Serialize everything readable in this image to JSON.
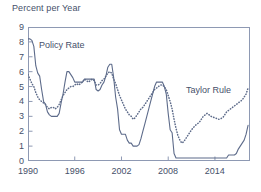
{
  "chart_data": {
    "type": "line",
    "title": "",
    "ylabel": "Percent per Year",
    "xlabel": "",
    "ylim": [
      0,
      9
    ],
    "xlim": [
      1990,
      2018.5
    ],
    "grid": false,
    "legend_position": "inline-annotations",
    "ytick_labels": [
      "0",
      "1",
      "2",
      "3",
      "4",
      "5",
      "6",
      "7",
      "8",
      "9"
    ],
    "ytick_values": [
      0,
      1,
      2,
      3,
      4,
      5,
      6,
      7,
      8,
      9
    ],
    "xtick_labels": [
      "1990",
      "1996",
      "2002",
      "2008",
      "2014"
    ],
    "xtick_values": [
      1990,
      1996,
      2002,
      2008,
      2014
    ],
    "series": [
      {
        "name": "Policy Rate",
        "style": "solid",
        "color": "#5d6b8a",
        "x": [
          1990.0,
          1990.25,
          1990.5,
          1990.75,
          1991.0,
          1991.25,
          1991.5,
          1991.75,
          1992.0,
          1992.25,
          1992.5,
          1992.75,
          1993.0,
          1993.25,
          1993.5,
          1993.75,
          1994.0,
          1994.25,
          1994.5,
          1994.75,
          1995.0,
          1995.25,
          1995.5,
          1995.75,
          1996.0,
          1996.25,
          1996.5,
          1996.75,
          1997.0,
          1997.25,
          1997.5,
          1997.75,
          1998.0,
          1998.25,
          1998.5,
          1998.75,
          1999.0,
          1999.25,
          1999.5,
          1999.75,
          2000.0,
          2000.25,
          2000.5,
          2000.75,
          2001.0,
          2001.25,
          2001.5,
          2001.75,
          2002.0,
          2002.25,
          2002.5,
          2002.75,
          2003.0,
          2003.25,
          2003.5,
          2003.75,
          2004.0,
          2004.25,
          2004.5,
          2004.75,
          2005.0,
          2005.25,
          2005.5,
          2005.75,
          2006.0,
          2006.25,
          2006.5,
          2006.75,
          2007.0,
          2007.25,
          2007.5,
          2007.75,
          2008.0,
          2008.25,
          2008.5,
          2008.75,
          2009.0,
          2009.5,
          2010.0,
          2010.5,
          2011.0,
          2011.5,
          2012.0,
          2012.5,
          2013.0,
          2013.5,
          2014.0,
          2014.5,
          2015.0,
          2015.5,
          2015.75,
          2016.0,
          2016.25,
          2016.5,
          2016.75,
          2017.0,
          2017.25,
          2017.5,
          2017.75,
          2018.0,
          2018.25
        ],
        "values": [
          8.2,
          8.2,
          8.1,
          7.7,
          6.4,
          5.9,
          5.7,
          4.8,
          4.0,
          3.8,
          3.3,
          3.1,
          3.0,
          3.0,
          3.0,
          3.0,
          3.2,
          3.9,
          4.5,
          5.3,
          6.0,
          6.0,
          5.8,
          5.6,
          5.3,
          5.3,
          5.3,
          5.3,
          5.3,
          5.5,
          5.5,
          5.5,
          5.5,
          5.5,
          5.5,
          4.8,
          4.7,
          4.8,
          5.1,
          5.3,
          5.7,
          6.3,
          6.5,
          6.5,
          5.6,
          4.3,
          3.5,
          2.1,
          1.8,
          1.8,
          1.8,
          1.4,
          1.2,
          1.2,
          1.0,
          1.0,
          1.0,
          1.1,
          1.5,
          2.0,
          2.5,
          3.0,
          3.5,
          4.0,
          4.5,
          5.0,
          5.3,
          5.3,
          5.3,
          5.3,
          5.0,
          4.5,
          3.2,
          2.1,
          1.9,
          0.5,
          0.2,
          0.2,
          0.2,
          0.2,
          0.2,
          0.2,
          0.2,
          0.2,
          0.2,
          0.2,
          0.2,
          0.2,
          0.2,
          0.2,
          0.4,
          0.4,
          0.4,
          0.4,
          0.5,
          0.8,
          1.0,
          1.2,
          1.4,
          1.8,
          2.4
        ]
      },
      {
        "name": "Taylor Rule",
        "style": "dotted",
        "color": "#5d6b8a",
        "x": [
          1990.0,
          1990.25,
          1990.5,
          1990.75,
          1991.0,
          1991.25,
          1991.5,
          1991.75,
          1992.0,
          1992.25,
          1992.5,
          1992.75,
          1993.0,
          1993.25,
          1993.5,
          1993.75,
          1994.0,
          1994.25,
          1994.5,
          1994.75,
          1995.0,
          1995.25,
          1995.5,
          1995.75,
          1996.0,
          1996.25,
          1996.5,
          1996.75,
          1997.0,
          1997.25,
          1997.5,
          1997.75,
          1998.0,
          1998.25,
          1998.5,
          1998.75,
          1999.0,
          1999.25,
          1999.5,
          1999.75,
          2000.0,
          2000.25,
          2000.5,
          2000.75,
          2001.0,
          2001.25,
          2001.5,
          2001.75,
          2002.0,
          2002.25,
          2002.5,
          2002.75,
          2003.0,
          2003.25,
          2003.5,
          2003.75,
          2004.0,
          2004.25,
          2004.5,
          2004.75,
          2005.0,
          2005.25,
          2005.5,
          2005.75,
          2006.0,
          2006.25,
          2006.5,
          2006.75,
          2007.0,
          2007.25,
          2007.5,
          2007.75,
          2008.0,
          2008.25,
          2008.5,
          2008.75,
          2009.0,
          2009.25,
          2009.5,
          2009.75,
          2010.0,
          2010.5,
          2011.0,
          2011.5,
          2012.0,
          2012.5,
          2013.0,
          2013.5,
          2014.0,
          2014.5,
          2015.0,
          2015.5,
          2016.0,
          2016.5,
          2017.0,
          2017.5,
          2018.0,
          2018.25
        ],
        "values": [
          5.8,
          5.5,
          5.2,
          5.0,
          4.6,
          4.3,
          4.1,
          4.0,
          3.9,
          3.8,
          3.6,
          3.5,
          3.6,
          3.6,
          3.5,
          3.6,
          3.8,
          4.1,
          4.4,
          4.6,
          4.8,
          4.9,
          5.0,
          5.0,
          5.1,
          5.2,
          5.1,
          5.2,
          5.3,
          5.5,
          5.4,
          5.3,
          5.4,
          5.5,
          5.4,
          5.1,
          5.1,
          5.2,
          5.4,
          5.5,
          5.7,
          5.9,
          6.0,
          5.9,
          5.5,
          5.2,
          4.8,
          4.4,
          4.1,
          3.8,
          3.5,
          3.3,
          3.1,
          3.0,
          2.8,
          2.9,
          3.1,
          3.3,
          3.5,
          3.6,
          3.8,
          4.0,
          4.2,
          4.4,
          4.6,
          4.8,
          4.9,
          5.0,
          5.1,
          5.1,
          5.0,
          4.8,
          4.4,
          4.0,
          3.5,
          2.8,
          2.2,
          1.7,
          1.4,
          1.2,
          1.3,
          1.7,
          2.1,
          2.4,
          2.6,
          3.0,
          3.2,
          3.0,
          2.9,
          2.8,
          2.9,
          3.3,
          3.5,
          3.7,
          3.9,
          4.1,
          4.5,
          4.9
        ]
      }
    ],
    "annotations": [
      {
        "text": "Policy Rate",
        "x": 1991.4,
        "y": 7.1
      },
      {
        "text": "Taylor Rule",
        "x": 2011.0,
        "y": 4.5
      }
    ]
  }
}
